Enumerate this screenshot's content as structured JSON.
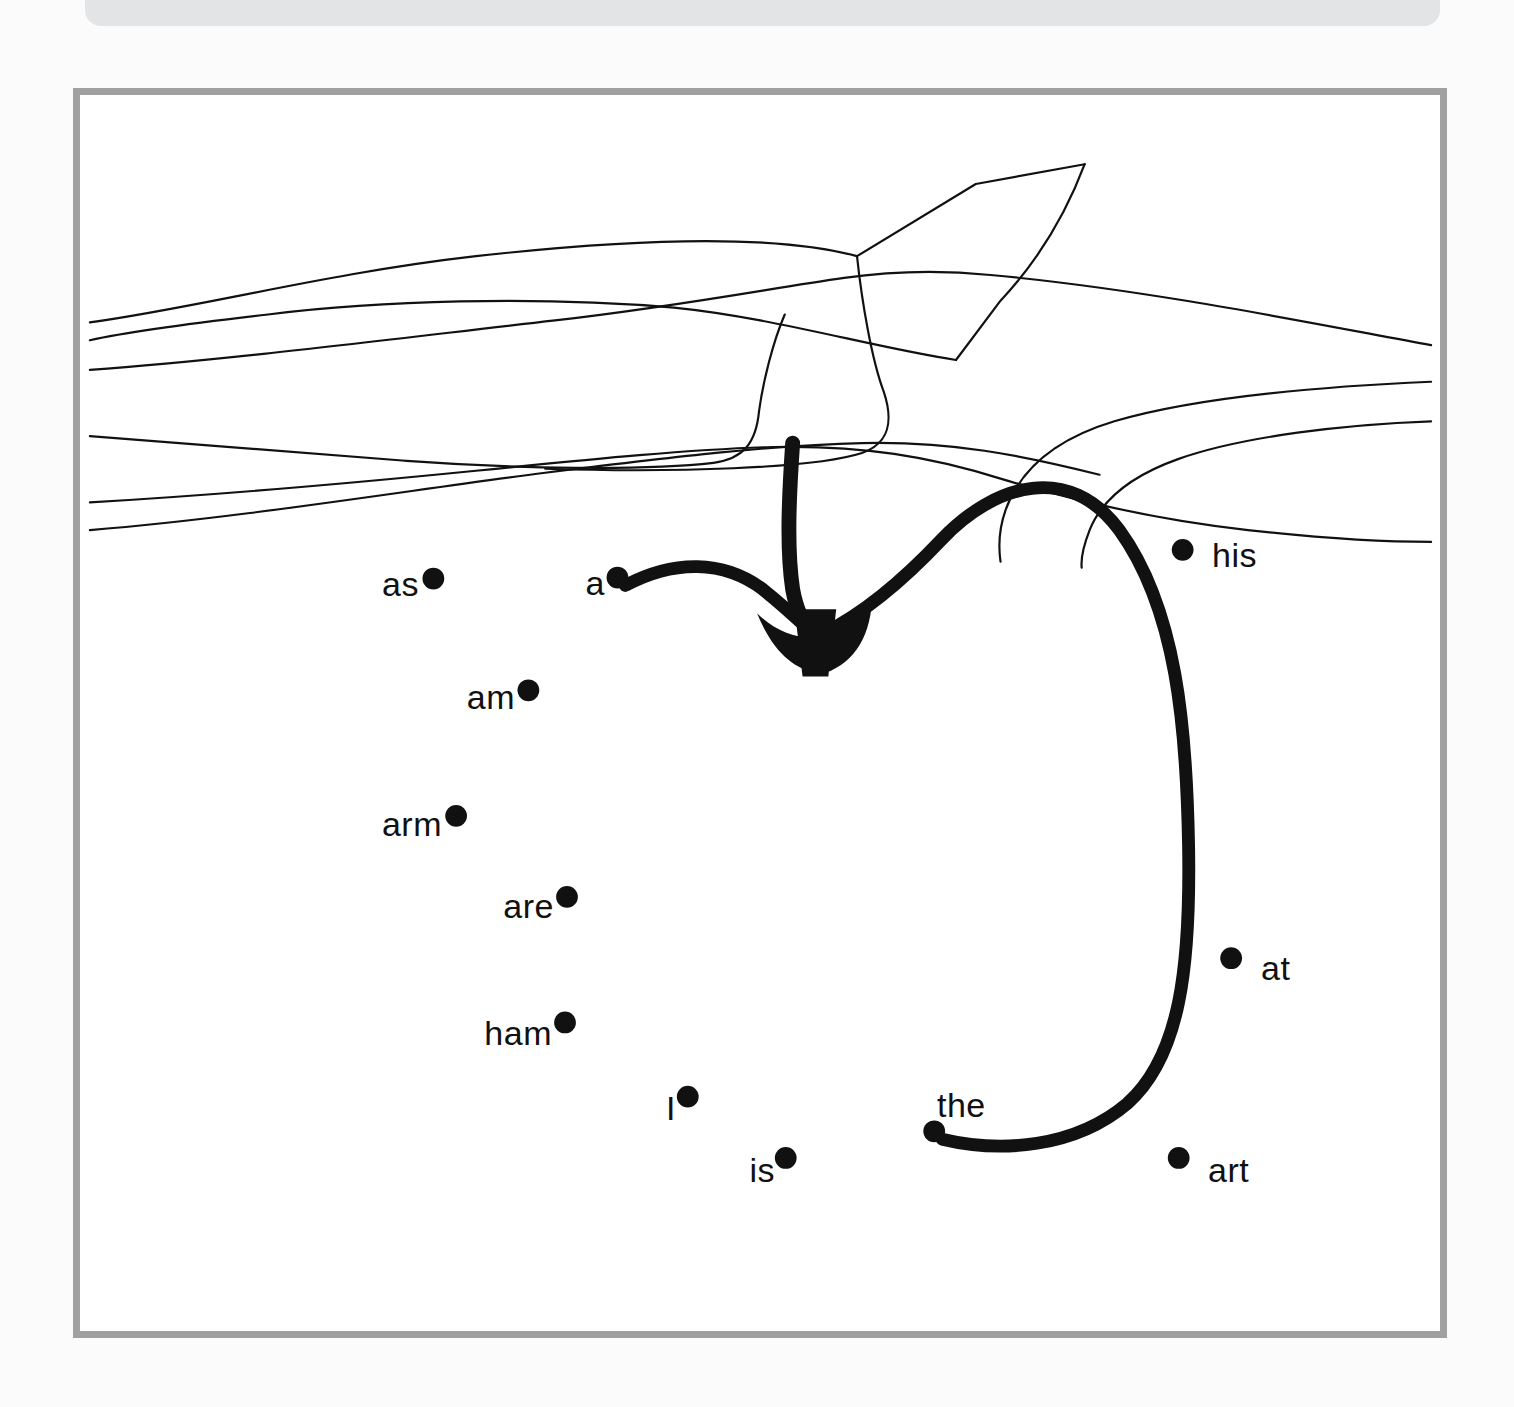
{
  "page": {
    "background_color": "#fbfbfc",
    "width": 1514,
    "height": 1407
  },
  "top_banner": {
    "name": "header-banner",
    "color": "#e3e4e6",
    "label": ""
  },
  "panel": {
    "border_color": "#a0a0a0",
    "background_color": "#ffffff",
    "title": ""
  },
  "illustration": {
    "name": "tree-branch-line-drawing",
    "stroke_color": "#111111",
    "stroke_width": 2.2,
    "description": "Line drawing of a tree branch spanning the top of the panel with an upward twig and a lower side branch"
  },
  "arrows": {
    "color": "#111111",
    "stroke_width": 13,
    "items": [
      {
        "name": "arrow-from-a",
        "from_word": "a",
        "to_target": "branch",
        "has_arrowhead": true
      },
      {
        "name": "arrow-from-the",
        "from_word": "the",
        "to_target": "branch",
        "has_arrowhead": true
      },
      {
        "name": "arrow-from-branch-down",
        "from_word": "branch",
        "to_target": "arrowhead",
        "has_arrowhead": true
      }
    ]
  },
  "word_dots": [
    {
      "id": "as",
      "label": "as",
      "x": 437,
      "y": 584,
      "label_side": "left",
      "connected": false
    },
    {
      "id": "a",
      "label": "a",
      "x": 623,
      "y": 583,
      "label_side": "left",
      "connected": true
    },
    {
      "id": "his",
      "label": "his",
      "x": 1194,
      "y": 555,
      "label_side": "right",
      "connected": false
    },
    {
      "id": "am",
      "label": "am",
      "x": 533,
      "y": 697,
      "label_side": "left",
      "connected": false
    },
    {
      "id": "arm",
      "label": "arm",
      "x": 460,
      "y": 824,
      "label_side": "left",
      "connected": false
    },
    {
      "id": "are",
      "label": "are",
      "x": 572,
      "y": 906,
      "label_side": "left",
      "connected": false
    },
    {
      "id": "at",
      "label": "at",
      "x": 1243,
      "y": 968,
      "label_side": "right",
      "connected": false
    },
    {
      "id": "ham",
      "label": "ham",
      "x": 570,
      "y": 1033,
      "label_side": "left",
      "connected": false
    },
    {
      "id": "I",
      "label": "I",
      "x": 694,
      "y": 1108,
      "label_side": "left",
      "connected": false
    },
    {
      "id": "the",
      "label": "the",
      "x": 943,
      "y": 1143,
      "label_side": "above",
      "connected": true
    },
    {
      "id": "is",
      "label": "is",
      "x": 793,
      "y": 1170,
      "label_side": "left",
      "connected": false
    },
    {
      "id": "art",
      "label": "art",
      "x": 1190,
      "y": 1170,
      "label_side": "right",
      "connected": false
    }
  ],
  "dot_radius": 11
}
